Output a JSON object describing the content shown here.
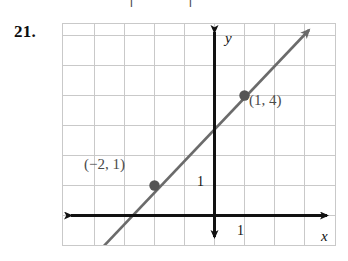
{
  "problem": {
    "number": "21.",
    "clipped_header_fragment": "|  |"
  },
  "graph": {
    "axis_labels": {
      "x": "x",
      "y": "y"
    },
    "unit_labels": {
      "x": "1",
      "y": "1"
    },
    "points": [
      {
        "label": "(−2, 1)",
        "x": -2,
        "y": 1
      },
      {
        "label": "(1, 4)",
        "x": 1,
        "y": 4
      }
    ],
    "line": {
      "slope": 1,
      "intercept": 3,
      "equation_hidden": true
    },
    "colors": {
      "grid": "#c9c9c9",
      "axis": "#111111",
      "line": "#6b6b6b",
      "point": "#555555",
      "label_text": "#4a4a4a",
      "background": "#ffffff",
      "number_text": "#0d0d0d"
    },
    "grid": {
      "columns": 9,
      "rows": 7,
      "cell_size_px": 30,
      "origin_px": {
        "x": 153,
        "y": 192
      },
      "x_range": [
        -5,
        4
      ],
      "y_range": [
        -1,
        6
      ]
    }
  }
}
